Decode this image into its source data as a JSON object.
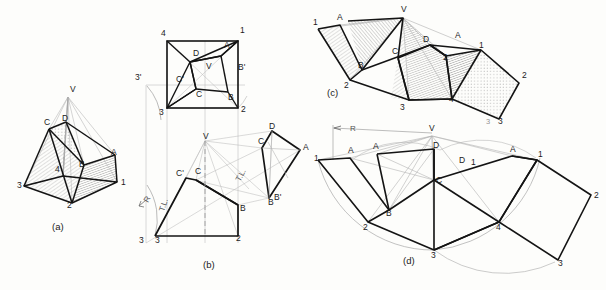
{
  "figure": {
    "background_color": "#fdfdfb",
    "ink_color": "#1a1a1a",
    "construction_color": "#9a9a9a",
    "hatch_color": "#8d8d8d"
  },
  "panels": [
    {
      "id": "a",
      "caption": "(a)",
      "description": "pictorial view of truncated pyramid",
      "vertex_labels": [
        "V",
        "C",
        "D",
        "A",
        "B",
        "4",
        "3",
        "2",
        "1"
      ]
    },
    {
      "id": "b",
      "caption": "(b)",
      "description": "orthographic top view, front view and true-length auxiliary",
      "vertex_labels": [
        "4",
        "1",
        "3",
        "2",
        "D",
        "A",
        "V",
        "C",
        "B",
        "C'",
        "B'",
        "3'"
      ],
      "annotations": [
        "R",
        "T.L.",
        "T.L."
      ]
    },
    {
      "id": "c",
      "caption": "(c)",
      "description": "shaded surface development",
      "vertex_labels": [
        "V",
        "1",
        "A",
        "B",
        "2",
        "C",
        "3",
        "D",
        "A",
        "1",
        "2",
        "4",
        "3",
        "2"
      ]
    },
    {
      "id": "d",
      "caption": "(d)",
      "description": "outline surface development with radius R",
      "vertex_labels": [
        "V",
        "1",
        "A",
        "A",
        "B",
        "2",
        "C",
        "D",
        "3",
        "4",
        "D",
        "A",
        "1",
        "2",
        "3"
      ],
      "annotations": [
        "R"
      ]
    }
  ],
  "panel_a": {
    "caption": "(a)",
    "labels": [
      {
        "text": "V",
        "x": 70,
        "y": 92
      },
      {
        "text": "D",
        "x": 62,
        "y": 121
      },
      {
        "text": "C",
        "x": 44,
        "y": 125
      },
      {
        "text": "A",
        "x": 111,
        "y": 155
      },
      {
        "text": "B",
        "x": 79,
        "y": 167
      },
      {
        "text": "4",
        "x": 55,
        "y": 172
      },
      {
        "text": "3",
        "x": 17,
        "y": 188
      },
      {
        "text": "2",
        "x": 67,
        "y": 208
      },
      {
        "text": "1",
        "x": 121,
        "y": 185
      }
    ]
  },
  "panel_b": {
    "caption": "(b)",
    "labels": [
      {
        "text": "4",
        "x": 161,
        "y": 36
      },
      {
        "text": "1",
        "x": 240,
        "y": 33
      },
      {
        "text": "D",
        "x": 193,
        "y": 56
      },
      {
        "text": "A",
        "x": 224,
        "y": 48
      },
      {
        "text": "V",
        "x": 206,
        "y": 69
      },
      {
        "text": "B'",
        "x": 238,
        "y": 70
      },
      {
        "text": "3'",
        "x": 137,
        "y": 80
      },
      {
        "text": "C'",
        "x": 179,
        "y": 82
      },
      {
        "text": "C",
        "x": 196,
        "y": 95
      },
      {
        "text": "B",
        "x": 228,
        "y": 98
      },
      {
        "text": "3",
        "x": 160,
        "y": 113
      },
      {
        "text": "2",
        "x": 240,
        "y": 110
      },
      {
        "text": "D",
        "x": 268,
        "y": 130
      },
      {
        "text": "V",
        "x": 206,
        "y": 139
      },
      {
        "text": "C",
        "x": 264,
        "y": 143
      },
      {
        "text": "A",
        "x": 301,
        "y": 149
      },
      {
        "text": "C'",
        "x": 178,
        "y": 176
      },
      {
        "text": "C",
        "x": 196,
        "y": 173
      },
      {
        "text": "B",
        "x": 254,
        "y": 187
      },
      {
        "text": "B'",
        "x": 274,
        "y": 200
      },
      {
        "text": "B",
        "x": 231,
        "y": 209
      },
      {
        "text": "3",
        "x": 139,
        "y": 240
      },
      {
        "text": "3",
        "x": 155,
        "y": 240
      },
      {
        "text": "2",
        "x": 237,
        "y": 238
      }
    ],
    "annotations": [
      {
        "text": "R",
        "x": 146,
        "y": 200,
        "rotate": -62
      },
      {
        "text": "T.L.",
        "x": 163,
        "y": 208,
        "rotate": -72
      },
      {
        "text": "T.L.",
        "x": 238,
        "y": 180,
        "rotate": -62
      }
    ]
  },
  "panel_c": {
    "caption": "(c)",
    "labels": [
      {
        "text": "V",
        "x": 404,
        "y": 12
      },
      {
        "text": "1",
        "x": 316,
        "y": 23
      },
      {
        "text": "A",
        "x": 340,
        "y": 19
      },
      {
        "text": "B",
        "x": 362,
        "y": 64
      },
      {
        "text": "2",
        "x": 348,
        "y": 84
      },
      {
        "text": "C",
        "x": 395,
        "y": 52
      },
      {
        "text": "3",
        "x": 404,
        "y": 105
      },
      {
        "text": "D",
        "x": 425,
        "y": 41
      },
      {
        "text": "A",
        "x": 457,
        "y": 38
      },
      {
        "text": "1",
        "x": 478,
        "y": 47
      },
      {
        "text": "2",
        "x": 445,
        "y": 60
      },
      {
        "text": "4",
        "x": 452,
        "y": 96
      },
      {
        "text": "2",
        "x": 521,
        "y": 76
      },
      {
        "text": "3",
        "x": 500,
        "y": 117
      }
    ]
  },
  "panel_d": {
    "caption": "(d)",
    "labels": [
      {
        "text": "V",
        "x": 432,
        "y": 130
      },
      {
        "text": "1",
        "x": 320,
        "y": 160
      },
      {
        "text": "A",
        "x": 351,
        "y": 152
      },
      {
        "text": "A",
        "x": 375,
        "y": 148
      },
      {
        "text": "B",
        "x": 389,
        "y": 205
      },
      {
        "text": "2",
        "x": 368,
        "y": 227
      },
      {
        "text": "D",
        "x": 435,
        "y": 149
      },
      {
        "text": "C",
        "x": 437,
        "y": 178
      },
      {
        "text": "D",
        "x": 461,
        "y": 161
      },
      {
        "text": "1",
        "x": 472,
        "y": 163
      },
      {
        "text": "3",
        "x": 434,
        "y": 250
      },
      {
        "text": "4",
        "x": 499,
        "y": 226
      },
      {
        "text": "A",
        "x": 512,
        "y": 154
      },
      {
        "text": "1",
        "x": 537,
        "y": 157
      },
      {
        "text": "2",
        "x": 591,
        "y": 195
      },
      {
        "text": "3",
        "x": 558,
        "y": 260
      }
    ],
    "annotations": [
      {
        "text": "R",
        "x": 352,
        "y": 130
      }
    ]
  },
  "stray_marks": [
    {
      "text": "3",
      "x": 488,
      "y": 122
    }
  ]
}
